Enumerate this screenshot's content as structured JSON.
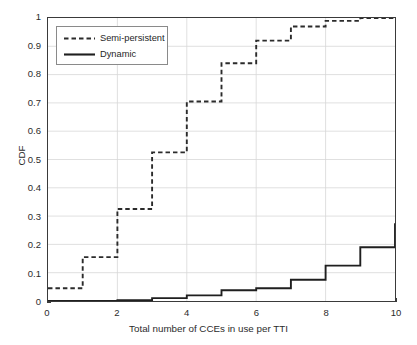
{
  "chart_data": {
    "type": "line",
    "title": "",
    "subtitle": "",
    "xlabel": "Total number of CCEs in use per TTI",
    "ylabel": "CDF",
    "xlim": [
      0,
      10
    ],
    "ylim": [
      0,
      1
    ],
    "xticks": [
      0,
      2,
      4,
      6,
      8,
      10
    ],
    "xtick_labels": [
      "0",
      "2",
      "4",
      "6",
      "8",
      "10"
    ],
    "yticks": [
      0,
      0.1,
      0.2,
      0.3,
      0.4,
      0.5,
      0.6,
      0.7,
      0.8,
      0.9,
      1
    ],
    "ytick_labels": [
      "0",
      "0.1",
      "0.2",
      "0.3",
      "0.4",
      "0.5",
      "0.6",
      "0.7",
      "0.8",
      "0.9",
      "1"
    ],
    "grid": true,
    "legend_position": "top-left",
    "x": [
      0,
      1,
      2,
      3,
      4,
      5,
      6,
      7,
      8,
      9,
      10
    ],
    "series": [
      {
        "name": "Semi-persistent",
        "style": "dashed",
        "color": "#2b2b2b",
        "values": [
          0.045,
          0.155,
          0.325,
          0.525,
          0.705,
          0.84,
          0.92,
          0.97,
          0.99,
          1.0,
          1.0
        ]
      },
      {
        "name": "Dynamic",
        "style": "solid",
        "color": "#1f1f1f",
        "values": [
          0.0,
          0.0,
          0.003,
          0.01,
          0.02,
          0.038,
          0.045,
          0.075,
          0.125,
          0.19,
          0.275
        ]
      }
    ]
  },
  "legend": {
    "entries": [
      {
        "label": "Semi-persistent",
        "style": "dashed"
      },
      {
        "label": "Dynamic",
        "style": "solid"
      }
    ]
  },
  "axes": {
    "x_label": "Total number of CCEs in use per TTI",
    "y_label": "CDF"
  }
}
